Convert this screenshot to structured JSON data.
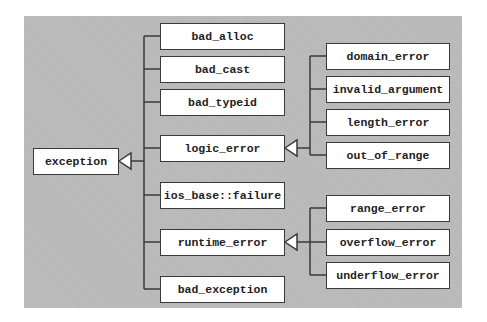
{
  "diagram": {
    "root": {
      "label": "exception"
    },
    "level1": [
      {
        "label": "bad_alloc"
      },
      {
        "label": "bad_cast"
      },
      {
        "label": "bad_typeid"
      },
      {
        "label": "logic_error"
      },
      {
        "label": "ios_base::failure"
      },
      {
        "label": "runtime_error"
      },
      {
        "label": "bad_exception"
      }
    ],
    "logic_error_children": [
      {
        "label": "domain_error"
      },
      {
        "label": "invalid_argument"
      },
      {
        "label": "length_error"
      },
      {
        "label": "out_of_range"
      }
    ],
    "runtime_error_children": [
      {
        "label": "range_error"
      },
      {
        "label": "overflow_error"
      },
      {
        "label": "underflow_error"
      }
    ],
    "colors": {
      "background": "#b8b8b8",
      "box": "#ffffff",
      "line": "#3a3a3a"
    }
  }
}
